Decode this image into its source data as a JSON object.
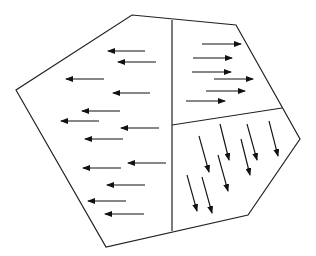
{
  "diagram": {
    "type": "polygon-regions-with-vector-arrows",
    "colors": {
      "background": "#ffffff",
      "stroke": "#222222",
      "arrow": "#111111"
    },
    "outline": {
      "points": [
        [
          132,
          15
        ],
        [
          236,
          25
        ],
        [
          300,
          139
        ],
        [
          248,
          215
        ],
        [
          106,
          247
        ],
        [
          16,
          90
        ]
      ]
    },
    "dividers": [
      {
        "name": "vertical-divider",
        "from": [
          172,
          20
        ],
        "to": [
          172,
          231
        ]
      },
      {
        "name": "horizontal-divider",
        "from": [
          172,
          125
        ],
        "to": [
          282,
          108
        ]
      }
    ],
    "regions": [
      {
        "name": "left-region",
        "direction": "left",
        "arrows": [
          [
            [
              145,
              51
            ],
            [
              108,
              51
            ]
          ],
          [
            [
              156,
              62
            ],
            [
              118,
              62
            ]
          ],
          [
            [
              104,
              79
            ],
            [
              66,
              79
            ]
          ],
          [
            [
              150,
              93
            ],
            [
              113,
              93
            ]
          ],
          [
            [
              120,
              111
            ],
            [
              82,
              111
            ]
          ],
          [
            [
              99,
              121
            ],
            [
              61,
              121
            ]
          ],
          [
            [
              159,
              128
            ],
            [
              121,
              128
            ]
          ],
          [
            [
              123,
              139
            ],
            [
              85,
              139
            ]
          ],
          [
            [
              166,
              163
            ],
            [
              128,
              163
            ]
          ],
          [
            [
              121,
              168
            ],
            [
              83,
              168
            ]
          ],
          [
            [
              145,
              185
            ],
            [
              107,
              185
            ]
          ],
          [
            [
              126,
              201
            ],
            [
              88,
              201
            ]
          ],
          [
            [
              144,
              214
            ],
            [
              105,
              214
            ]
          ]
        ]
      },
      {
        "name": "top-right-region",
        "direction": "right",
        "arrows": [
          [
            [
              202,
              44
            ],
            [
              241,
              44
            ]
          ],
          [
            [
              193,
              58
            ],
            [
              232,
              58
            ]
          ],
          [
            [
              192,
              72
            ],
            [
              231,
              72
            ]
          ],
          [
            [
              214,
              79
            ],
            [
              253,
              79
            ]
          ],
          [
            [
              206,
              91
            ],
            [
              245,
              91
            ]
          ],
          [
            [
              186,
              101
            ],
            [
              225,
              101
            ]
          ]
        ]
      },
      {
        "name": "bottom-right-region",
        "direction": "down-right",
        "arrows": [
          [
            [
              199,
              136
            ],
            [
              209,
              172
            ]
          ],
          [
            [
              220,
              124
            ],
            [
              229,
              160
            ]
          ],
          [
            [
              247,
              124
            ],
            [
              257,
              160
            ]
          ],
          [
            [
              269,
              121
            ],
            [
              278,
              156
            ]
          ],
          [
            [
              241,
              139
            ],
            [
              250,
              175
            ]
          ],
          [
            [
              218,
              155
            ],
            [
              228,
              191
            ]
          ],
          [
            [
              187,
              175
            ],
            [
              197,
              211
            ]
          ],
          [
            [
              202,
              177
            ],
            [
              212,
              213
            ]
          ]
        ]
      }
    ]
  }
}
